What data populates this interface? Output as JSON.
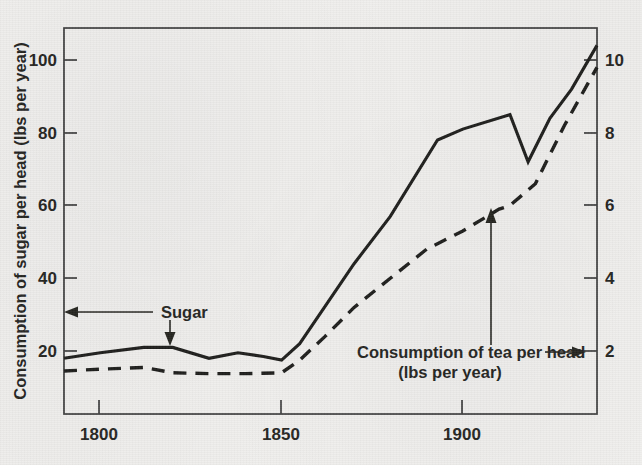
{
  "chart_data": {
    "type": "line",
    "title": "",
    "subtitle": "",
    "xlabel": "",
    "ylabel": "Consumption of sugar per head (lbs per year)",
    "y2label": "Consumption of tea per head (lbs per year)",
    "xlim": [
      1790,
      1937
    ],
    "ylim": [
      0,
      110
    ],
    "y2lim": [
      0,
      11
    ],
    "grid": false,
    "legend_position": "inline-annotations",
    "x_ticks": [
      1800,
      1850,
      1900
    ],
    "x_tick_labels": [
      "1800",
      "1850",
      "1900"
    ],
    "y_ticks": [
      20,
      40,
      60,
      80,
      100
    ],
    "y_tick_labels": [
      "20",
      "40",
      "60",
      "80",
      "100"
    ],
    "y2_ticks": [
      2,
      4,
      6,
      8,
      10
    ],
    "y2_tick_labels": [
      "2",
      "4",
      "6",
      "8",
      "10"
    ],
    "series": [
      {
        "name": "Sugar",
        "style": "solid",
        "axis": "left",
        "unit": "lbs per year",
        "x": [
          1790,
          1800,
          1812,
          1820,
          1830,
          1838,
          1845,
          1850,
          1855,
          1870,
          1880,
          1893,
          1900,
          1913,
          1918,
          1924,
          1930,
          1937
        ],
        "values": [
          18,
          19.5,
          21,
          21,
          18,
          19.5,
          18.5,
          17.5,
          22,
          44,
          57,
          78,
          81,
          85,
          72,
          84,
          92,
          104
        ]
      },
      {
        "name": "Consumption of tea per head",
        "style": "dashed",
        "axis": "right",
        "unit": "lbs per year",
        "x": [
          1790,
          1800,
          1812,
          1820,
          1830,
          1840,
          1850,
          1855,
          1862,
          1870,
          1880,
          1890,
          1900,
          1910,
          1913,
          1920,
          1928,
          1937
        ],
        "values": [
          1.45,
          1.5,
          1.55,
          1.4,
          1.38,
          1.38,
          1.4,
          1.75,
          2.4,
          3.2,
          4.0,
          4.8,
          5.3,
          5.9,
          6.0,
          6.6,
          8.2,
          9.8
        ]
      }
    ],
    "annotations": [
      {
        "id": "sugar-annotation",
        "text": "Sugar",
        "points_to": "left-axis-and-sugar-line"
      },
      {
        "id": "tea-annotation",
        "line1": "Consumption of tea per head",
        "line2": "(lbs per year)",
        "points_to": "right-axis-and-tea-line"
      }
    ],
    "colors": {
      "background": "#f1f0ee",
      "ink": "#1d1d1b",
      "axis": "#3c3c3c",
      "text": "#24241f"
    }
  }
}
